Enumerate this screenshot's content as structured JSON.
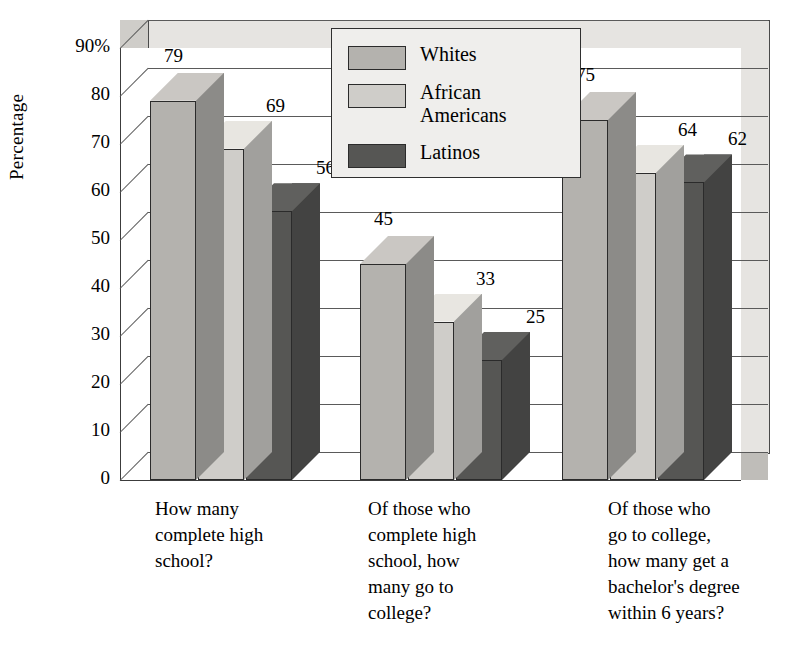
{
  "chart_data": {
    "type": "bar",
    "title": "",
    "xlabel": "",
    "ylabel": "Percentage",
    "ylim": [
      0,
      90
    ],
    "yticks": [
      "0",
      "10",
      "20",
      "30",
      "40",
      "50",
      "60",
      "70",
      "80",
      "90%"
    ],
    "grid": true,
    "legend_position": "top-center",
    "categories": [
      "How many complete high school?",
      "Of those who complete high school, how many go to college?",
      "Of those who go to college, how many get a bachelor's degree within 6 years?"
    ],
    "series": [
      {
        "name": "Whites",
        "values": [
          79,
          45,
          75
        ],
        "color": "#b4b2ae"
      },
      {
        "name": "African Americans",
        "values": [
          69,
          33,
          64
        ],
        "color": "#cfcdc9"
      },
      {
        "name": "Latinos",
        "values": [
          56,
          25,
          62
        ],
        "color": "#565654"
      }
    ]
  },
  "axis": {
    "ylabel": "Percentage",
    "ticks": [
      {
        "label": "90%",
        "value": 90
      },
      {
        "label": "80",
        "value": 80
      },
      {
        "label": "70",
        "value": 70
      },
      {
        "label": "60",
        "value": 60
      },
      {
        "label": "50",
        "value": 50
      },
      {
        "label": "40",
        "value": 40
      },
      {
        "label": "30",
        "value": 30
      },
      {
        "label": "20",
        "value": 20
      },
      {
        "label": "10",
        "value": 10
      },
      {
        "label": "0",
        "value": 0
      }
    ]
  },
  "legend": {
    "items": [
      {
        "label": "Whites",
        "label2": "",
        "color": "#b4b2ae"
      },
      {
        "label": "African",
        "label2": "Americans",
        "color": "#cfcdc9"
      },
      {
        "label": "Latinos",
        "label2": "",
        "color": "#565654"
      }
    ]
  },
  "groups": [
    {
      "caption_lines": [
        "How many",
        "complete high",
        "school?"
      ],
      "bars": [
        {
          "series": "Whites",
          "value": 79,
          "label": "79"
        },
        {
          "series": "African Americans",
          "value": 69,
          "label": "69"
        },
        {
          "series": "Latinos",
          "value": 56,
          "label": "56"
        }
      ]
    },
    {
      "caption_lines": [
        "Of those who",
        "complete high",
        "school, how",
        "many go to",
        "college?"
      ],
      "bars": [
        {
          "series": "Whites",
          "value": 45,
          "label": "45"
        },
        {
          "series": "African Americans",
          "value": 33,
          "label": "33"
        },
        {
          "series": "Latinos",
          "value": 25,
          "label": "25"
        }
      ]
    },
    {
      "caption_lines": [
        "Of those who",
        "go to college,",
        "how many get a",
        "bachelor's degree",
        "within 6 years?"
      ],
      "bars": [
        {
          "series": "Whites",
          "value": 75,
          "label": "75"
        },
        {
          "series": "African Americans",
          "value": 64,
          "label": "64"
        },
        {
          "series": "Latinos",
          "value": 62,
          "label": "62"
        }
      ]
    }
  ]
}
